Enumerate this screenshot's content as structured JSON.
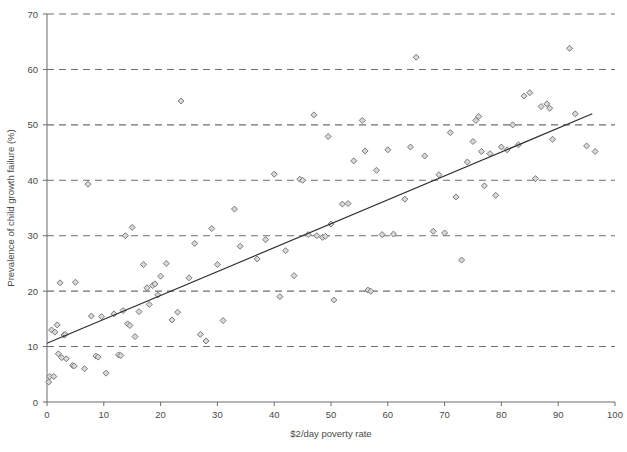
{
  "chart_data": {
    "type": "scatter",
    "title": "",
    "xlabel": "$2/day poverty rate",
    "ylabel": "Prevalence of child growth failure (%)",
    "xlim": [
      0,
      100
    ],
    "ylim": [
      0,
      70
    ],
    "xticks": [
      0,
      10,
      20,
      30,
      40,
      50,
      60,
      70,
      80,
      90,
      100
    ],
    "yticks": [
      0,
      10,
      20,
      30,
      40,
      50,
      60,
      70
    ],
    "grid": "horizontal-dashed",
    "legend": "none",
    "marker": "diamond",
    "marker_fill": "#d9d9d9",
    "marker_edge": "#6d6d6d",
    "trendline": {
      "label": "linear fit",
      "color": "#2e2e2e",
      "x": [
        0,
        96
      ],
      "y": [
        10.6,
        52.0
      ],
      "slope": 0.431,
      "intercept": 10.6
    },
    "points": [
      {
        "x": 0.3,
        "y": 3.6
      },
      {
        "x": 0.5,
        "y": 4.6
      },
      {
        "x": 0.8,
        "y": 13.0
      },
      {
        "x": 1.2,
        "y": 4.6
      },
      {
        "x": 1.4,
        "y": 12.6
      },
      {
        "x": 1.8,
        "y": 13.9
      },
      {
        "x": 2.0,
        "y": 8.7
      },
      {
        "x": 2.3,
        "y": 21.5
      },
      {
        "x": 2.6,
        "y": 8.0
      },
      {
        "x": 3.0,
        "y": 12.1
      },
      {
        "x": 3.2,
        "y": 12.2
      },
      {
        "x": 3.4,
        "y": 7.8
      },
      {
        "x": 4.5,
        "y": 6.6
      },
      {
        "x": 4.8,
        "y": 6.5
      },
      {
        "x": 5.0,
        "y": 21.6
      },
      {
        "x": 6.6,
        "y": 6.0
      },
      {
        "x": 7.2,
        "y": 39.3
      },
      {
        "x": 7.8,
        "y": 15.5
      },
      {
        "x": 8.6,
        "y": 8.3
      },
      {
        "x": 9.0,
        "y": 8.1
      },
      {
        "x": 9.6,
        "y": 15.4
      },
      {
        "x": 10.4,
        "y": 5.2
      },
      {
        "x": 11.8,
        "y": 15.9
      },
      {
        "x": 12.6,
        "y": 8.5
      },
      {
        "x": 13.0,
        "y": 8.4
      },
      {
        "x": 13.4,
        "y": 16.5
      },
      {
        "x": 13.8,
        "y": 30.0
      },
      {
        "x": 14.2,
        "y": 14.1
      },
      {
        "x": 14.6,
        "y": 13.8
      },
      {
        "x": 15.0,
        "y": 31.5
      },
      {
        "x": 15.5,
        "y": 11.8
      },
      {
        "x": 16.2,
        "y": 16.3
      },
      {
        "x": 17.0,
        "y": 24.8
      },
      {
        "x": 17.6,
        "y": 20.6
      },
      {
        "x": 18.0,
        "y": 17.6
      },
      {
        "x": 18.6,
        "y": 21.0
      },
      {
        "x": 19.0,
        "y": 21.3
      },
      {
        "x": 19.5,
        "y": 19.3
      },
      {
        "x": 20.0,
        "y": 22.7
      },
      {
        "x": 21.0,
        "y": 25.0
      },
      {
        "x": 22.0,
        "y": 14.8
      },
      {
        "x": 23.0,
        "y": 16.2
      },
      {
        "x": 23.6,
        "y": 54.3
      },
      {
        "x": 25.0,
        "y": 22.4
      },
      {
        "x": 26.0,
        "y": 28.6
      },
      {
        "x": 27.0,
        "y": 12.2
      },
      {
        "x": 28.0,
        "y": 11.0
      },
      {
        "x": 29.0,
        "y": 31.3
      },
      {
        "x": 30.0,
        "y": 24.8
      },
      {
        "x": 31.0,
        "y": 14.7
      },
      {
        "x": 33.0,
        "y": 34.8
      },
      {
        "x": 34.0,
        "y": 28.1
      },
      {
        "x": 37.0,
        "y": 25.8
      },
      {
        "x": 38.5,
        "y": 29.3
      },
      {
        "x": 40.0,
        "y": 41.1
      },
      {
        "x": 41.0,
        "y": 19.0
      },
      {
        "x": 42.0,
        "y": 27.3
      },
      {
        "x": 43.5,
        "y": 22.8
      },
      {
        "x": 44.5,
        "y": 40.2
      },
      {
        "x": 45.0,
        "y": 40.0
      },
      {
        "x": 46.0,
        "y": 30.2
      },
      {
        "x": 47.0,
        "y": 51.8
      },
      {
        "x": 47.5,
        "y": 30.0
      },
      {
        "x": 48.5,
        "y": 29.7
      },
      {
        "x": 49.0,
        "y": 29.9
      },
      {
        "x": 49.5,
        "y": 47.9
      },
      {
        "x": 50.0,
        "y": 32.1
      },
      {
        "x": 50.5,
        "y": 18.4
      },
      {
        "x": 52.0,
        "y": 35.7
      },
      {
        "x": 53.0,
        "y": 35.8
      },
      {
        "x": 54.0,
        "y": 43.5
      },
      {
        "x": 55.5,
        "y": 50.8
      },
      {
        "x": 56.0,
        "y": 45.3
      },
      {
        "x": 56.5,
        "y": 20.2
      },
      {
        "x": 57.0,
        "y": 20.0
      },
      {
        "x": 58.0,
        "y": 41.8
      },
      {
        "x": 59.0,
        "y": 30.2
      },
      {
        "x": 60.0,
        "y": 45.5
      },
      {
        "x": 61.0,
        "y": 30.3
      },
      {
        "x": 63.0,
        "y": 36.6
      },
      {
        "x": 64.0,
        "y": 46.0
      },
      {
        "x": 65.0,
        "y": 62.2
      },
      {
        "x": 66.5,
        "y": 44.4
      },
      {
        "x": 68.0,
        "y": 30.8
      },
      {
        "x": 69.0,
        "y": 41.0
      },
      {
        "x": 70.0,
        "y": 30.5
      },
      {
        "x": 71.0,
        "y": 48.6
      },
      {
        "x": 72.0,
        "y": 37.0
      },
      {
        "x": 73.0,
        "y": 25.6
      },
      {
        "x": 74.0,
        "y": 43.3
      },
      {
        "x": 75.0,
        "y": 47.0
      },
      {
        "x": 75.5,
        "y": 50.8
      },
      {
        "x": 76.0,
        "y": 51.5
      },
      {
        "x": 76.5,
        "y": 45.2
      },
      {
        "x": 77.0,
        "y": 39.0
      },
      {
        "x": 78.0,
        "y": 44.8
      },
      {
        "x": 79.0,
        "y": 37.3
      },
      {
        "x": 80.0,
        "y": 46.0
      },
      {
        "x": 81.0,
        "y": 45.5
      },
      {
        "x": 82.0,
        "y": 50.0
      },
      {
        "x": 83.0,
        "y": 46.4
      },
      {
        "x": 84.0,
        "y": 55.2
      },
      {
        "x": 85.0,
        "y": 55.8
      },
      {
        "x": 86.0,
        "y": 40.3
      },
      {
        "x": 87.0,
        "y": 53.3
      },
      {
        "x": 88.0,
        "y": 53.8
      },
      {
        "x": 88.5,
        "y": 53.0
      },
      {
        "x": 89.0,
        "y": 47.4
      },
      {
        "x": 92.0,
        "y": 63.8
      },
      {
        "x": 93.0,
        "y": 52.0
      },
      {
        "x": 95.0,
        "y": 46.2
      },
      {
        "x": 96.5,
        "y": 45.2
      }
    ]
  }
}
